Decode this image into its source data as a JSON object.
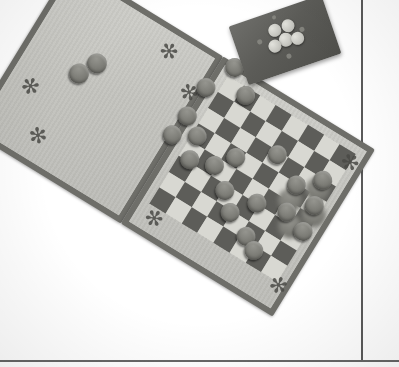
{
  "scene": {
    "title": "Checkers board game photograph",
    "description": "Overhead photo of a folding checkers/draughts board on a white surface, with a separate dark tray holding light playing pieces",
    "background_color": "#ffffff",
    "width": 399,
    "height": 367
  },
  "colors": {
    "background": "#ffffff",
    "board_frame": "#6e6e69",
    "board_panel_light": "#c6c6c1",
    "square_light": "#d8d8d2",
    "square_dark": "#5d5d59",
    "piece_dark": "#7b7b75",
    "piece_light": "#c6c6c0",
    "tray": "#5c5c58",
    "table_line": "#3d3d3d",
    "decor": "#4a4a46"
  },
  "table": {
    "vertical_edge_label": "table-edge-vertical",
    "horizontal_edge_label": "table-edge-horizontal"
  },
  "board": {
    "type": "folding checkers board",
    "rotation_degrees": 31.5,
    "halves": [
      {
        "id": "left",
        "role": "storage panel with decorative corners"
      },
      {
        "id": "right",
        "role": "playing surface with 8x8 checkerboard"
      }
    ],
    "grid": {
      "rows": 8,
      "cols": 8,
      "light": "light square",
      "dark": "dark square"
    },
    "decorations": {
      "motif": "asterisk-star",
      "glyph": "✻",
      "count": 6
    }
  },
  "checkerboard_squares": [
    [
      "light",
      "dark",
      "light",
      "dark",
      "light",
      "dark",
      "light",
      "dark"
    ],
    [
      "dark",
      "light",
      "dark",
      "light",
      "dark",
      "light",
      "dark",
      "light"
    ],
    [
      "light",
      "dark",
      "light",
      "dark",
      "light",
      "dark",
      "light",
      "dark"
    ],
    [
      "dark",
      "light",
      "dark",
      "light",
      "dark",
      "light",
      "dark",
      "light"
    ],
    [
      "light",
      "dark",
      "light",
      "dark",
      "light",
      "dark",
      "light",
      "dark"
    ],
    [
      "dark",
      "light",
      "dark",
      "light",
      "dark",
      "light",
      "dark",
      "light"
    ],
    [
      "light",
      "dark",
      "light",
      "dark",
      "light",
      "dark",
      "light",
      "dark"
    ],
    [
      "dark",
      "light",
      "dark",
      "light",
      "dark",
      "light",
      "dark",
      "light"
    ]
  ],
  "board_pieces": [
    {
      "id": "p1",
      "color": "dark",
      "x": 6,
      "y": -6,
      "d": 19
    },
    {
      "id": "p2",
      "color": "dark",
      "x": 30,
      "y": 12,
      "d": 19
    },
    {
      "id": "p3",
      "color": "dark",
      "x": -8,
      "y": 26,
      "d": 19
    },
    {
      "id": "p4",
      "color": "dark",
      "x": -9,
      "y": 60,
      "d": 19
    },
    {
      "id": "p5",
      "color": "dark",
      "x": -12,
      "y": 84,
      "d": 19
    },
    {
      "id": "p6",
      "color": "dark",
      "x": 10,
      "y": 72,
      "d": 19
    },
    {
      "id": "p7",
      "color": "dark",
      "x": 16,
      "y": 96,
      "d": 19
    },
    {
      "id": "p8",
      "color": "dark",
      "x": 40,
      "y": 88,
      "d": 19
    },
    {
      "id": "p9",
      "color": "dark",
      "x": 54,
      "y": 70,
      "d": 19
    },
    {
      "id": "p10",
      "color": "dark",
      "x": 62,
      "y": 104,
      "d": 19
    },
    {
      "id": "p11",
      "color": "dark",
      "x": 78,
      "y": 120,
      "d": 19
    },
    {
      "id": "p12",
      "color": "dark",
      "x": 96,
      "y": 98,
      "d": 19
    },
    {
      "id": "p13",
      "color": "dark",
      "x": 104,
      "y": 132,
      "d": 19
    },
    {
      "id": "p14",
      "color": "dark",
      "x": 120,
      "y": 62,
      "d": 19
    },
    {
      "id": "p15",
      "color": "dark",
      "x": 126,
      "y": 90,
      "d": 19
    },
    {
      "id": "p16",
      "color": "dark",
      "x": 140,
      "y": 44,
      "d": 19
    },
    {
      "id": "p17",
      "color": "dark",
      "x": 146,
      "y": 70,
      "d": 19
    },
    {
      "id": "p18",
      "color": "dark",
      "x": 150,
      "y": 98,
      "d": 19
    },
    {
      "id": "p19",
      "color": "dark",
      "x": 118,
      "y": 140,
      "d": 19
    },
    {
      "id": "p20",
      "color": "dark",
      "x": 88,
      "y": 46,
      "d": 19
    }
  ],
  "storage_pieces_left": [
    {
      "id": "s1",
      "color": "dark",
      "x": 58,
      "y": 56,
      "d": 20
    },
    {
      "id": "s2",
      "color": "dark",
      "x": 48,
      "y": 74,
      "d": 20
    }
  ],
  "storage_pieces_right": [
    {
      "id": "r1",
      "color": "dark",
      "x": 132,
      "y": 46,
      "d": 24
    },
    {
      "id": "r2",
      "color": "dark",
      "x": 114,
      "y": 70,
      "d": 24
    },
    {
      "id": "r3",
      "color": "dark",
      "x": 142,
      "y": 70,
      "d": 24
    },
    {
      "id": "r4",
      "color": "dark",
      "x": 128,
      "y": 92,
      "d": 24
    }
  ],
  "tray": {
    "label": "dark tray with light checkers",
    "rotation_degrees": -19,
    "pieces": [
      {
        "id": "t1",
        "x": 36,
        "y": 12,
        "d": 13
      },
      {
        "id": "t2",
        "x": 50,
        "y": 12,
        "d": 13
      },
      {
        "id": "t3",
        "x": 43,
        "y": 24,
        "d": 14
      },
      {
        "id": "t4",
        "x": 31,
        "y": 27,
        "d": 13
      },
      {
        "id": "t5",
        "x": 55,
        "y": 27,
        "d": 13
      }
    ],
    "specks": [
      {
        "id": "d1",
        "x": 44,
        "y": 4,
        "d": 4
      },
      {
        "id": "d2",
        "x": 22,
        "y": 22,
        "d": 5
      },
      {
        "id": "d3",
        "x": 66,
        "y": 24,
        "d": 5
      },
      {
        "id": "d4",
        "x": 45,
        "y": 45,
        "d": 5
      }
    ]
  },
  "decor_positions": {
    "left_half": [
      {
        "id": "dl1",
        "x": 112,
        "y": 8,
        "rot": 0
      },
      {
        "id": "dl2",
        "x": 150,
        "y": 32,
        "rot": 15
      },
      {
        "id": "dl3",
        "x": 12,
        "y": 110,
        "rot": -10
      },
      {
        "id": "dl4",
        "x": 44,
        "y": 148,
        "rot": 20
      }
    ],
    "right_half": [
      {
        "id": "dr1",
        "x": 146,
        "y": 8,
        "rot": 10
      },
      {
        "id": "dr2",
        "x": 150,
        "y": 150,
        "rot": -10
      },
      {
        "id": "dr3",
        "x": 8,
        "y": 158,
        "rot": 5
      }
    ]
  }
}
